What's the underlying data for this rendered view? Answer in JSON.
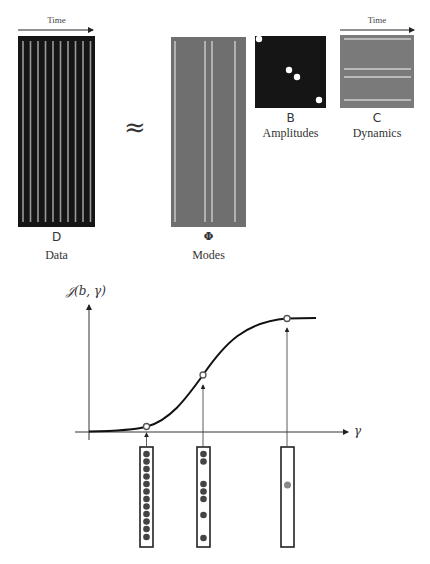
{
  "top": {
    "data_matrix": {
      "symbol": "D",
      "caption": "Data",
      "time_label": "Time",
      "stripe_count": 10,
      "bg_color": "#151515",
      "stripe_color": "#9a9a9a"
    },
    "approx_symbol": "≈",
    "modes_matrix": {
      "symbol": "Φ",
      "caption": "Modes",
      "stripe_count": 4,
      "bg_color": "#6f6f6f",
      "stripe_color": "#c2c2c2"
    },
    "amplitudes_matrix": {
      "symbol": "B",
      "caption": "Amplitudes",
      "nonzero_diagonal_entries": 4,
      "bg_color": "#151515",
      "dot_color": "#ffffff"
    },
    "dynamics_matrix": {
      "symbol": "C",
      "caption": "Dynamics",
      "time_label": "Time",
      "stripe_count": 4,
      "bg_color": "#7a7a7a",
      "stripe_color": "#cfcfcf"
    }
  },
  "bottom": {
    "y_axis_label": "𝒥(b, γ)",
    "x_axis_label": "γ",
    "curve": "sigmoid",
    "marked_points": [
      {
        "position": "low",
        "nonzero_count": 12
      },
      {
        "position": "middle",
        "nonzero_count": 7
      },
      {
        "position": "high",
        "nonzero_count": 1
      }
    ]
  }
}
